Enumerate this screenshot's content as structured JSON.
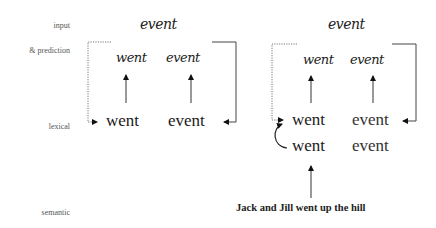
{
  "row_labels": {
    "input": "input",
    "prediction": "& prediction",
    "lexical": "lexical",
    "semantic": "semantic"
  },
  "left_panel": {
    "input_word": "event",
    "predicted_words": [
      "went",
      "event"
    ],
    "lexical_words": [
      "went",
      "event"
    ]
  },
  "right_panel": {
    "input_word": "event",
    "predicted_words": [
      "went",
      "event"
    ],
    "lexical_words_top": [
      "went",
      "event"
    ],
    "lexical_words_bottom": [
      "went",
      "event"
    ],
    "semantic_context": "Jack and Jill went up the hill"
  }
}
